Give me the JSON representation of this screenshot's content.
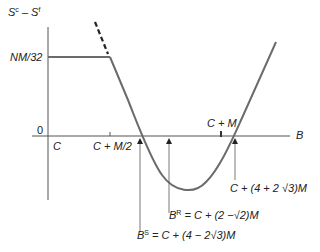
{
  "diagram": {
    "y_axis_label": {
      "base1": "S",
      "sup1": "c",
      "minus": " – ",
      "base2": "S",
      "sup2": "f"
    },
    "x_axis_label": "B",
    "y_ticks": {
      "upper": "NM/32",
      "zero": "0"
    },
    "x_ticks": {
      "origin": "C",
      "half": "C + M/2",
      "full": "C + M"
    },
    "annotations": {
      "right_root": "C + (4 + 2 √3)M",
      "b_r": {
        "base": "B",
        "sup": "R",
        "rest": " = C + (2 −√2)M"
      },
      "b_s": {
        "base": "B",
        "sup": "S",
        "rest": " = C + (4 − 2√3)M"
      }
    },
    "colors": {
      "curve": "#6b6b6b",
      "axis": "#555555",
      "text": "#222222"
    }
  }
}
